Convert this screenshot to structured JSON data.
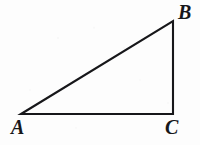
{
  "figure": {
    "kind": "geometry-diagram",
    "shape": "right-triangle",
    "canvas": {
      "width": 200,
      "height": 145,
      "background": "#fdfdfd"
    },
    "stroke": {
      "color": "#17171a",
      "width": 2.1,
      "linejoin": "miter",
      "linecap": "butt"
    },
    "labels": {
      "a": "A",
      "b": "B",
      "c": "C"
    },
    "vertices": [
      {
        "name": "A",
        "x": 21,
        "y": 114
      },
      {
        "name": "B",
        "x": 173,
        "y": 21
      },
      {
        "name": "C",
        "x": 173,
        "y": 114
      }
    ],
    "edges": [
      {
        "name": "AB",
        "from": "A",
        "to": "B",
        "role": "hypotenuse"
      },
      {
        "name": "BC",
        "from": "B",
        "to": "C",
        "role": "vertical-leg"
      },
      {
        "name": "CA",
        "from": "C",
        "to": "A",
        "role": "horizontal-leg"
      }
    ],
    "path": "M 21 114 L 173 21 L 173 114 Z",
    "right_angle_at": "C",
    "label_positions": {
      "a": {
        "x": 11,
        "y": 117
      },
      "b": {
        "x": 178,
        "y": 2
      },
      "c": {
        "x": 165,
        "y": 117
      }
    }
  }
}
